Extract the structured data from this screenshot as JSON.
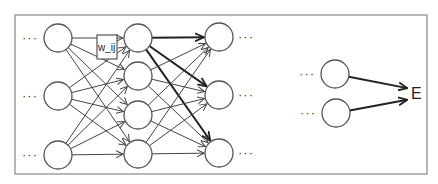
{
  "diagram": {
    "title": "",
    "frame": {
      "x": 15,
      "y": 15,
      "width": 412,
      "height": 159
    },
    "node_radius": 14,
    "layers": [
      {
        "name": "layer-input",
        "x": 58,
        "ys": [
          38,
          96,
          155
        ]
      },
      {
        "name": "layer-hidden",
        "x": 138,
        "ys": [
          38,
          76,
          115,
          154
        ]
      },
      {
        "name": "layer-next",
        "x": 219,
        "ys": [
          37,
          95,
          153
        ]
      }
    ],
    "output_nodes": [
      {
        "x": 335,
        "y": 74
      },
      {
        "x": 336,
        "y": 113
      }
    ],
    "ellipsis": "···",
    "weight_label": "w_ij",
    "weight_box": {
      "x": 97,
      "y": 35,
      "width": 20,
      "height": 24
    },
    "output_label": "E",
    "output_label_pos": {
      "x": 411,
      "y": 99
    },
    "bold_edges_from": {
      "layer": 1,
      "index": 0
    },
    "colors": {
      "stroke": "#555555",
      "edge": "#444444",
      "edge_bold": "#222222",
      "frame": "#888888",
      "background": "#ffffff"
    }
  }
}
